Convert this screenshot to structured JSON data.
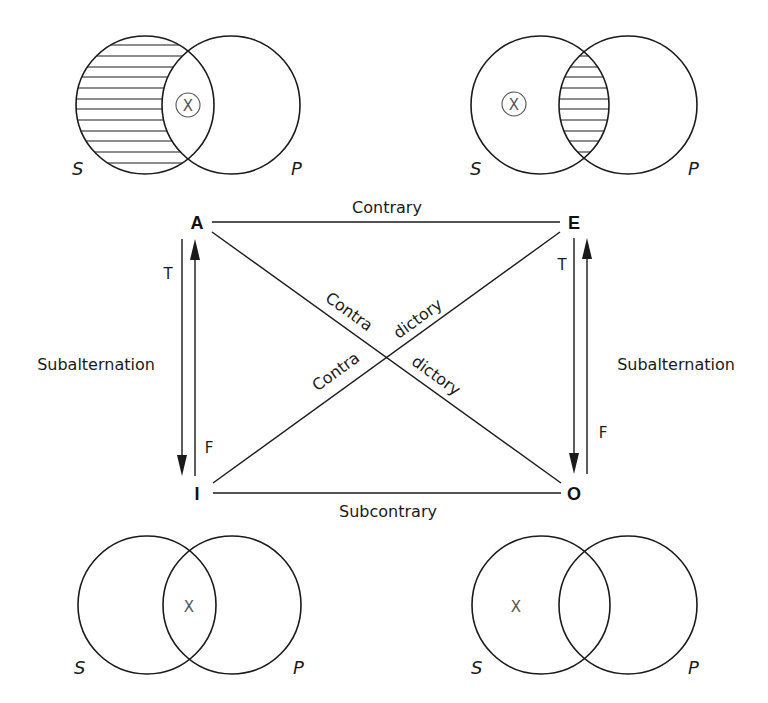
{
  "figure": {
    "title_fragment": "g p"
  },
  "corners": {
    "A": "A",
    "E": "E",
    "I": "I",
    "O": "O"
  },
  "relations": {
    "top": "Contrary",
    "bottom": "Subcontrary",
    "left": "Subalternation",
    "right": "Subalternation",
    "diagonal_part1": "Contra",
    "diagonal_part2": "dictory"
  },
  "truth_labels": {
    "left_down": "T",
    "left_up": "F",
    "right_down": "T",
    "right_up": "F"
  },
  "venn": {
    "top_left": {
      "proposition": "A",
      "subject_label": "S",
      "predicate_label": "P",
      "shaded_region": "S only",
      "mark": "X",
      "mark_style": "circled",
      "mark_region": "S and P"
    },
    "top_right": {
      "proposition": "E",
      "subject_label": "S",
      "predicate_label": "P",
      "shaded_region": "S and P",
      "mark": "X",
      "mark_style": "circled",
      "mark_region": "S only"
    },
    "bottom_left": {
      "proposition": "I",
      "subject_label": "S",
      "predicate_label": "P",
      "shaded_region": "none",
      "mark": "X",
      "mark_style": "plain",
      "mark_region": "S and P"
    },
    "bottom_right": {
      "proposition": "O",
      "subject_label": "S",
      "predicate_label": "P",
      "shaded_region": "none",
      "mark": "X",
      "mark_style": "plain",
      "mark_region": "S only"
    }
  },
  "colors": {
    "ink": "#1a1a1a",
    "mark": "#555555",
    "background": "#ffffff"
  }
}
